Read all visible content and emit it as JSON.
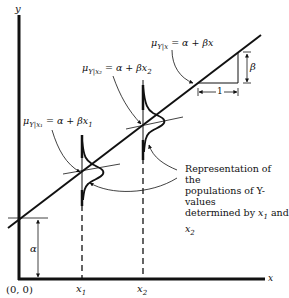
{
  "axes": {
    "y_label": "y",
    "x_label": "x",
    "origin_label": "(0, 0)",
    "x1_label": "x",
    "x1_sub": "1",
    "x2_label": "x",
    "x2_sub": "2"
  },
  "equations": {
    "general": {
      "mu": "μ",
      "sub": "Y|x",
      "rhs": " = α + βx"
    },
    "at_x2": {
      "mu": "μ",
      "sub": "Y|x₂",
      "rhs": " = α + βx",
      "rhs_sub": "2"
    },
    "at_x1": {
      "mu": "μ",
      "sub": "Y|x₁",
      "rhs": " = α + βx",
      "rhs_sub": "1"
    }
  },
  "slope": {
    "beta_label": "β",
    "run_label": "1"
  },
  "intercept": {
    "alpha_label": "α"
  },
  "annotation": {
    "line1": "Representation of the",
    "line2": "populations of Y-values",
    "line3_prefix": "determined by ",
    "line3_x1": "x",
    "line3_sub1": "1",
    "line3_and": " and ",
    "line3_x2": "x",
    "line3_sub2": "2"
  }
}
